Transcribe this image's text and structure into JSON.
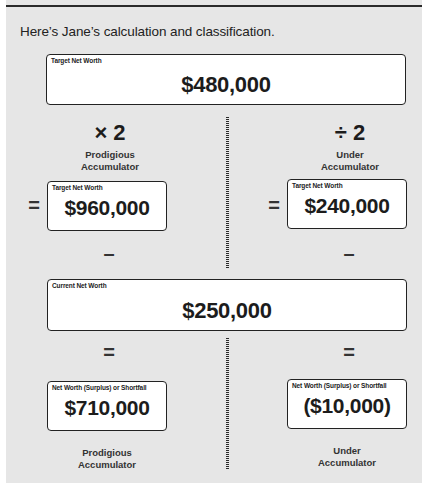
{
  "intro_text": "Here’s Jane’s calculation and classification.",
  "target_box": {
    "label": "Target Net Worth",
    "value": "$480,000"
  },
  "left_column": {
    "operator": "× 2",
    "category": [
      "Prodigious",
      "Accumulator"
    ],
    "equals": "=",
    "result_box": {
      "label": "Target Net Worth",
      "value": "$960,000"
    },
    "minus": "–",
    "equals_2": "=",
    "shortfall_box": {
      "label": "Net Worth (Surplus) or Shortfall",
      "value": "$710,000"
    },
    "classification": [
      "Prodigious",
      "Accumulator"
    ]
  },
  "right_column": {
    "operator": "÷ 2",
    "category": [
      "Under",
      "Accumulator"
    ],
    "equals": "=",
    "result_box": {
      "label": "Target Net Worth",
      "value": "$240,000"
    },
    "minus": "–",
    "equals_2": "=",
    "shortfall_box": {
      "label": "Net Worth (Surplus) or Shortfall",
      "value": "($10,000)"
    },
    "classification": [
      "Under",
      "Accumulator"
    ]
  },
  "current_box": {
    "label": "Current Net Worth",
    "value": "$250,000"
  },
  "colors": {
    "panel_bg": "#e6e6e6",
    "box_bg": "#ffffff",
    "border": "#222222",
    "text": "#1c1c1c"
  }
}
